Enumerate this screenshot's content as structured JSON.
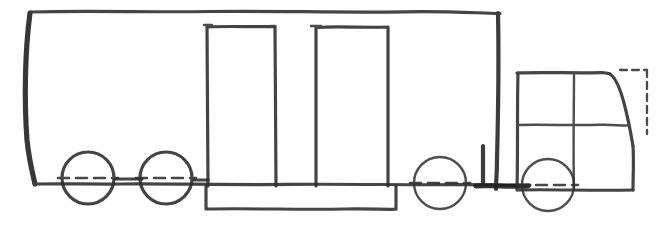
{
  "document": {
    "title": "Truck Side Elevation Sketch",
    "medium": "hand-drawn pencil line drawing",
    "view": "side elevation, facing right",
    "background_color": "#fefefe",
    "ink_color": "#262626"
  },
  "canvas": {
    "width": 667,
    "height": 229
  },
  "diagram": {
    "parts": [
      {
        "id": "trailer-body",
        "label": "Trailer Body"
      },
      {
        "id": "trailer-deck",
        "label": "Trailer Deck"
      },
      {
        "id": "lower-rail",
        "label": "Lower Chassis Rail"
      },
      {
        "id": "upright-box-left",
        "label": "Left Upright Box"
      },
      {
        "id": "upright-box-right",
        "label": "Right Upright Box"
      },
      {
        "id": "cab",
        "label": "Cab"
      },
      {
        "id": "windshield",
        "label": "Sloped Windshield"
      },
      {
        "id": "kingpin-post",
        "label": "Kingpin Post"
      },
      {
        "id": "construction-lines",
        "label": "Dashed Construction Lines"
      }
    ]
  },
  "geometry": {
    "trailer_body": {
      "top_line": {
        "x1": 31,
        "y1": 12,
        "x2": 500,
        "y2": 14
      },
      "left_edge": {
        "x1": 29,
        "y1": 12,
        "x2": 36,
        "y2": 184
      },
      "right_edge": {
        "x1": 499,
        "y1": 14,
        "x2": 496,
        "y2": 190
      },
      "deck_line": {
        "x1": 34,
        "y1": 184,
        "x2": 530,
        "y2": 186
      }
    },
    "upright_box_left": {
      "x": 207,
      "y": 26,
      "width": 68,
      "height": 160
    },
    "upright_box_right": {
      "x": 315,
      "y": 27,
      "width": 72,
      "height": 159
    },
    "lower_rail": {
      "x": 205,
      "y": 186,
      "width": 190,
      "height": 23
    },
    "cab": {
      "left_edge": {
        "x1": 517,
        "y1": 73,
        "x2": 517,
        "y2": 190
      },
      "roof": {
        "x1": 517,
        "y1": 73,
        "x2": 608,
        "y2": 73
      },
      "b_pillar": {
        "x1": 573,
        "y1": 73,
        "x2": 573,
        "y2": 190
      },
      "sill": {
        "x1": 517,
        "y1": 125,
        "x2": 627,
        "y2": 125
      },
      "windshield": {
        "x1": 609,
        "y1": 75,
        "x2": 632,
        "y2": 145
      },
      "front_edge": {
        "x1": 632,
        "y1": 145,
        "x2": 632,
        "y2": 190
      },
      "bottom": {
        "x1": 517,
        "y1": 190,
        "x2": 632,
        "y2": 190
      }
    },
    "dashed_bracket": {
      "top": {
        "x1": 622,
        "y1": 70,
        "x2": 646,
        "y2": 70
      },
      "side": {
        "x1": 646,
        "y1": 70,
        "x2": 646,
        "y2": 133
      }
    },
    "kingpin_post": {
      "left": {
        "x1": 482,
        "y1": 145,
        "x2": 482,
        "y2": 187
      },
      "right": {
        "x1": 500,
        "y1": 145,
        "x2": 500,
        "y2": 187
      }
    }
  },
  "wheels": [
    {
      "id": "wheel-1",
      "label": "Rear trailer wheel",
      "cx": 88,
      "cy": 178,
      "r": 26
    },
    {
      "id": "wheel-2",
      "label": "Second trailer wheel",
      "cx": 166,
      "cy": 178,
      "r": 26
    },
    {
      "id": "wheel-3",
      "label": "Drive wheel",
      "cx": 440,
      "cy": 183,
      "r": 26
    },
    {
      "id": "wheel-4",
      "label": "Front steer wheel",
      "cx": 548,
      "cy": 185,
      "r": 26
    }
  ],
  "wheel_style": {
    "stroke_width": 3.2,
    "centerline": "dash-dot horizontal through hub",
    "fill": "none"
  },
  "counts": {
    "wheels": 4,
    "upright_boxes": 2,
    "axles": 4
  }
}
